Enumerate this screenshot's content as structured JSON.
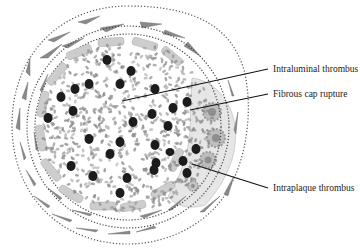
{
  "diagram": {
    "labels": [
      {
        "id": "intraluminal",
        "text": "Intraluminal thrombus",
        "x": 272,
        "y": 64,
        "pointer_from": [
          268,
          69
        ],
        "pointer_to": [
          122,
          101
        ]
      },
      {
        "id": "fibrous-cap",
        "text": "Fibrous cap rupture",
        "x": 272,
        "y": 88,
        "pointer_from": [
          268,
          94
        ],
        "pointer_to": [
          190,
          110
        ]
      },
      {
        "id": "intraplaque",
        "text": "Intraplaque thrombus",
        "x": 272,
        "y": 182,
        "pointer_from": [
          268,
          188
        ],
        "pointer_to": [
          192,
          164
        ]
      }
    ],
    "colors": {
      "background": "#ffffff",
      "rbc": "#8a8a8a",
      "wbc": "#1e1e1e",
      "endothelium": "#c9c9c9",
      "smooth_muscle": "#7d7d7d",
      "plaque": "#d8d8d8",
      "foam_cell": "#b0b0b0",
      "dotted_line": "#555555",
      "pointer": "#111111",
      "text": "#222222"
    }
  }
}
